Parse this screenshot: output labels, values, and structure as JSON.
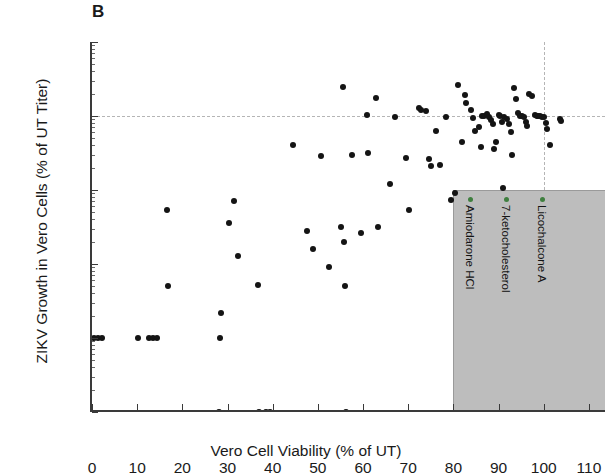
{
  "panel": {
    "label": "B"
  },
  "chart_data": {
    "type": "scatter",
    "title": "",
    "panel_label": "B",
    "xlabel": "Vero Cell Viability (% of UT)",
    "ylabel": "ZIKV Growth in Vero Cells (% of UT Titer)",
    "xlim": [
      0,
      114
    ],
    "ylim": [
      0.01,
      1000
    ],
    "yscale": "log",
    "xscale": "linear",
    "grid": false,
    "xticks": [
      0,
      10,
      20,
      30,
      40,
      50,
      60,
      70,
      80,
      90,
      100,
      110
    ],
    "xticklabels": [
      "0",
      "10",
      "20",
      "30",
      "40",
      "50",
      "60",
      "70",
      "80",
      "90",
      "100",
      "110"
    ],
    "yticks": [
      0.01,
      0.1,
      1,
      10,
      100,
      1000
    ],
    "yticklabels": [
      "0.01",
      "0.1",
      "1",
      "10",
      "100",
      "1000"
    ],
    "reference_lines": [
      {
        "orientation": "horizontal",
        "value": 100,
        "style": "dashed",
        "color": "#b5b5b5"
      },
      {
        "orientation": "vertical",
        "value": 100,
        "style": "dashed",
        "color": "#b5b5b5"
      }
    ],
    "marker": {
      "shape": "circle",
      "color": "#141414",
      "size": 6
    },
    "series": [
      {
        "name": "compounds",
        "points": [
          [
            0.4,
            0.1
          ],
          [
            1.4,
            0.1
          ],
          [
            2.2,
            0.1
          ],
          [
            10.2,
            0.1
          ],
          [
            12.6,
            0.1
          ],
          [
            13.6,
            0.1
          ],
          [
            14.4,
            0.1
          ],
          [
            16.6,
            5.4
          ],
          [
            16.8,
            0.5
          ],
          [
            28.2,
            0.01
          ],
          [
            28.4,
            0.1
          ],
          [
            28.6,
            0.22
          ],
          [
            30.4,
            3.6
          ],
          [
            31.4,
            7.2
          ],
          [
            32.4,
            1.3
          ],
          [
            37.0,
            0.01
          ],
          [
            38.6,
            0.01
          ],
          [
            39.4,
            0.01
          ],
          [
            36.8,
            0.52
          ],
          [
            44.6,
            41.0
          ],
          [
            47.6,
            2.8
          ],
          [
            49.0,
            1.6
          ],
          [
            50.8,
            29.0
          ],
          [
            52.4,
            0.9
          ],
          [
            55.6,
            250.0
          ],
          [
            56.2,
            0.01
          ],
          [
            56.0,
            0.5
          ],
          [
            55.2,
            3.2
          ],
          [
            55.8,
            2.0
          ],
          [
            57.6,
            30.0
          ],
          [
            59.6,
            2.6
          ],
          [
            60.8,
            104.0
          ],
          [
            61.0,
            32.0
          ],
          [
            62.8,
            175.0
          ],
          [
            63.4,
            3.2
          ],
          [
            66.0,
            12.0
          ],
          [
            67.0,
            96.0
          ],
          [
            69.6,
            27.0
          ],
          [
            70.2,
            5.4
          ],
          [
            72.4,
            130.0
          ],
          [
            72.8,
            120.0
          ],
          [
            74.0,
            118.0
          ],
          [
            74.6,
            26.0
          ],
          [
            75.0,
            21.0
          ],
          [
            76.2,
            62.0
          ],
          [
            77.0,
            22.0
          ],
          [
            78.4,
            96.0
          ],
          [
            79.4,
            7.4
          ],
          [
            81.0,
            260.0
          ],
          [
            82.6,
            190.0
          ],
          [
            82.8,
            150.0
          ],
          [
            84.0,
            120.0
          ],
          [
            84.4,
            95.0
          ],
          [
            84.8,
            62.0
          ],
          [
            85.6,
            72.0
          ],
          [
            86.4,
            100.0
          ],
          [
            86.8,
            100.0
          ],
          [
            87.4,
            105.0
          ],
          [
            87.8,
            96.0
          ],
          [
            88.4,
            88.0
          ],
          [
            88.8,
            78.0
          ],
          [
            89.4,
            44.0
          ],
          [
            90.0,
            102.0
          ],
          [
            90.4,
            100.0
          ],
          [
            90.8,
            84.0
          ],
          [
            91.2,
            96.0
          ],
          [
            91.8,
            90.0
          ],
          [
            92.4,
            78.0
          ],
          [
            92.8,
            60.0
          ],
          [
            93.4,
            240.0
          ],
          [
            93.8,
            170.0
          ],
          [
            94.4,
            110.0
          ],
          [
            94.8,
            100.0
          ],
          [
            95.2,
            100.0
          ],
          [
            95.6,
            96.0
          ],
          [
            96.0,
            82.0
          ],
          [
            96.4,
            74.0
          ],
          [
            96.8,
            200.0
          ],
          [
            97.4,
            185.0
          ],
          [
            98.0,
            103.0
          ],
          [
            98.4,
            100.0
          ],
          [
            98.8,
            100.0
          ],
          [
            99.2,
            100.0
          ],
          [
            99.6,
            98.0
          ],
          [
            100.0,
            96.0
          ],
          [
            100.4,
            80.0
          ],
          [
            100.8,
            66.0
          ],
          [
            101.4,
            40.0
          ],
          [
            103.6,
            92.0
          ],
          [
            103.8,
            86.0
          ],
          [
            86.2,
            38.0
          ],
          [
            89.0,
            36.0
          ],
          [
            91.0,
            10.5
          ],
          [
            93.0,
            30.0
          ],
          [
            82.0,
            44.0
          ],
          [
            80.4,
            9.0
          ]
        ]
      }
    ],
    "shaded_region": {
      "x_start": 80,
      "x_end": 114,
      "y_start": 0.01,
      "y_end": 10,
      "color": "#bdbdbd"
    },
    "annotations": [
      {
        "label": "Amiodarone HCl",
        "marker_color": "#3f7f3f",
        "x": 84.5
      },
      {
        "label": "7-ketocholesterol",
        "marker_color": "#3f7f3f",
        "x": 92.5
      },
      {
        "label": "Licochalcone A",
        "marker_color": "#3f7f3f",
        "x": 100.5
      }
    ]
  }
}
